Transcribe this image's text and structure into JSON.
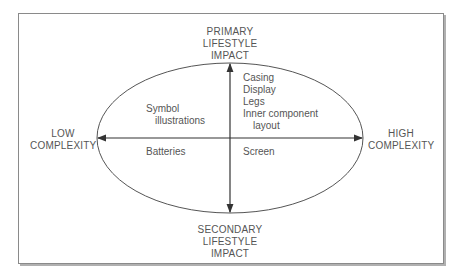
{
  "diagram": {
    "axes": {
      "top": [
        "PRIMARY",
        "LIFESTYLE",
        "IMPACT"
      ],
      "bottom": [
        "SECONDARY",
        "LIFESTYLE",
        "IMPACT"
      ],
      "left": [
        "LOW",
        "COMPLEXITY"
      ],
      "right": [
        "HIGH",
        "COMPLEXITY"
      ]
    },
    "quadrants": {
      "top_left": [
        "Symbol",
        "illustrations"
      ],
      "top_right": [
        "Casing",
        "Display",
        "Legs",
        "Inner component",
        "layout"
      ],
      "bottom_left": [
        "Batteries"
      ],
      "bottom_right": [
        "Screen"
      ]
    },
    "colors": {
      "line": "#444444",
      "text": "#555555",
      "frame": "#8a8a8a"
    }
  }
}
